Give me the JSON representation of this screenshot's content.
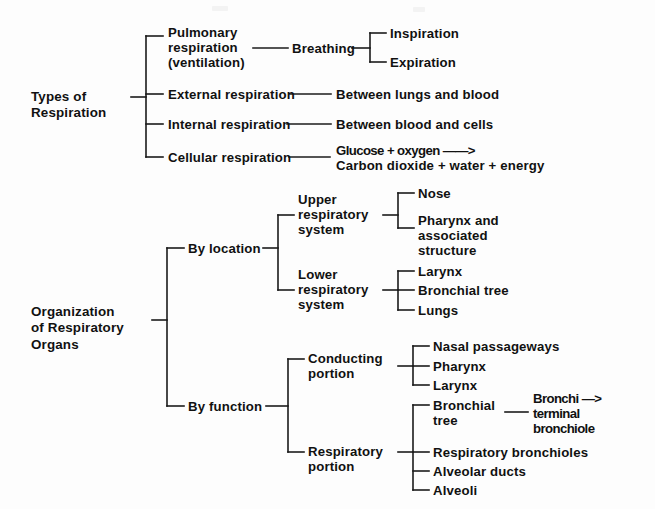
{
  "document": {
    "title": "Respiration Concept Diagram",
    "background_color": "#fdfdfd",
    "ink_color": "#1b1b1b"
  },
  "diagram": {
    "type": "hierarchical-bracket-tree",
    "roots": [
      {
        "id": "types-of-respiration",
        "label": "Types of\nRespiration",
        "children": [
          {
            "id": "pulmonary-respiration",
            "label": "Pulmonary\nrespiration\n(ventilation)",
            "children": [
              {
                "id": "breathing",
                "label": "Breathing",
                "children": [
                  {
                    "id": "inspiration",
                    "label": "Inspiration"
                  },
                  {
                    "id": "expiration",
                    "label": "Expiration"
                  }
                ]
              }
            ]
          },
          {
            "id": "external-respiration",
            "label": "External respiration",
            "children": [
              {
                "id": "between-lungs-and-blood",
                "label": "Between lungs and blood"
              }
            ]
          },
          {
            "id": "internal-respiration",
            "label": "Internal respiration",
            "children": [
              {
                "id": "between-blood-and-cells",
                "label": "Between blood and cells"
              }
            ]
          },
          {
            "id": "cellular-respiration",
            "label": "Cellular respiration",
            "children": [
              {
                "id": "cellular-respiration-equation",
                "label": "Glucose + oxygen ——>\nCarbon dioxide + water + energy",
                "equation": {
                  "reactants": "Glucose + oxygen",
                  "arrow": "——>",
                  "products": "Carbon dioxide + water + energy"
                }
              }
            ]
          }
        ]
      },
      {
        "id": "organization-of-respiratory-organs",
        "label": "Organization\nof Respiratory\nOrgans",
        "children": [
          {
            "id": "by-location",
            "label": "By location",
            "children": [
              {
                "id": "upper-respiratory-system",
                "label": "Upper\nrespiratory\nsystem",
                "children": [
                  {
                    "id": "nose",
                    "label": "Nose"
                  },
                  {
                    "id": "pharynx-and-associated-structure",
                    "label": "Pharynx and\nassociated\nstructure"
                  }
                ]
              },
              {
                "id": "lower-respiratory-system",
                "label": "Lower\nrespiratory\nsystem",
                "children": [
                  {
                    "id": "larynx-lower",
                    "label": "Larynx"
                  },
                  {
                    "id": "bronchial-tree-lower",
                    "label": "Bronchial tree"
                  },
                  {
                    "id": "lungs",
                    "label": "Lungs"
                  }
                ]
              }
            ]
          },
          {
            "id": "by-function",
            "label": "By function",
            "children": [
              {
                "id": "conducting-portion",
                "label": "Conducting\nportion",
                "children": [
                  {
                    "id": "nasal-passageways",
                    "label": "Nasal passageways"
                  },
                  {
                    "id": "pharynx-conducting",
                    "label": "Pharynx"
                  },
                  {
                    "id": "larynx-conducting",
                    "label": "Larynx"
                  }
                ]
              },
              {
                "id": "respiratory-portion",
                "label": "Respiratory\nportion",
                "children": [
                  {
                    "id": "bronchial-tree-respiratory",
                    "label": "Bronchial\ntree",
                    "children": [
                      {
                        "id": "bronchi-terminal-bronchiole",
                        "label": "Bronchi —>\nterminal\nbronchiole"
                      }
                    ]
                  },
                  {
                    "id": "respiratory-bronchioles",
                    "label": "Respiratory bronchioles"
                  },
                  {
                    "id": "alveolar-ducts",
                    "label": "Alveolar ducts"
                  },
                  {
                    "id": "alveoli",
                    "label": "Alveoli"
                  }
                ]
              }
            ]
          }
        ]
      }
    ]
  },
  "labels": {
    "types_of_respiration": "Types of\nRespiration",
    "pulmonary_respiration": "Pulmonary\nrespiration\n(ventilation)",
    "breathing": "Breathing",
    "inspiration": "Inspiration",
    "expiration": "Expiration",
    "external_respiration": "External respiration",
    "between_lungs_and_blood": "Between lungs and blood",
    "internal_respiration": "Internal respiration",
    "between_blood_and_cells": "Between blood and cells",
    "cellular_respiration": "Cellular respiration",
    "equation_line1": "Glucose + oxygen ——>",
    "equation_line2": "Carbon dioxide + water + energy",
    "organization_of_respiratory_organs": "Organization\nof Respiratory\nOrgans",
    "by_location": "By location",
    "upper_respiratory_system": "Upper\nrespiratory\nsystem",
    "nose": "Nose",
    "pharynx_and_associated_structure": "Pharynx and\nassociated\nstructure",
    "lower_respiratory_system": "Lower\nrespiratory\nsystem",
    "larynx_lower": "Larynx",
    "bronchial_tree_lower": "Bronchial tree",
    "lungs": "Lungs",
    "by_function": "By function",
    "conducting_portion": "Conducting\nportion",
    "nasal_passageways": "Nasal passageways",
    "pharynx_conducting": "Pharynx",
    "larynx_conducting": "Larynx",
    "respiratory_portion": "Respiratory\nportion",
    "bronchial_tree_respiratory": "Bronchial\ntree",
    "bronchi_terminal_bronchiole": "Bronchi —>\nterminal\nbronchiole",
    "respiratory_bronchioles": "Respiratory bronchioles",
    "alveolar_ducts": "Alveolar ducts",
    "alveoli": "Alveoli"
  }
}
